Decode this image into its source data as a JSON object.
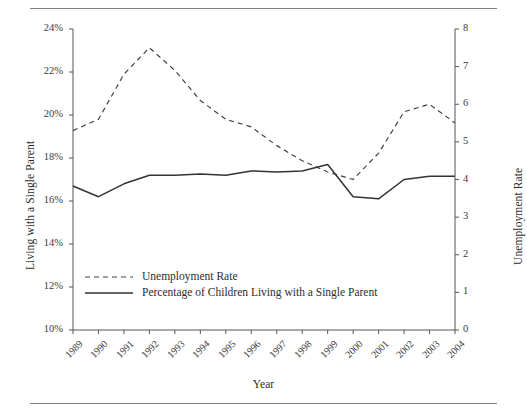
{
  "chart_data": {
    "type": "line",
    "title": "",
    "xlabel": "Year",
    "ylabel": "Living with a Single Parent",
    "ylabel_secondary": "Unemployment Rate",
    "grid": false,
    "legend_position": "inside-bottom-left",
    "categories": [
      "1989",
      "1990",
      "1991",
      "1992",
      "1993",
      "1994",
      "1995",
      "1996",
      "1997",
      "1998",
      "1999",
      "2000",
      "2001",
      "2002",
      "2003",
      "2004"
    ],
    "axes": {
      "left": {
        "label": "Living with a Single Parent",
        "ylim": [
          10,
          24
        ],
        "tick_step": 2,
        "ticks": [
          "10%",
          "12%",
          "14%",
          "16%",
          "18%",
          "20%",
          "22%",
          "24%"
        ],
        "tick_values": [
          10,
          12,
          14,
          16,
          18,
          20,
          22,
          24
        ]
      },
      "right": {
        "label": "Unemployment Rate",
        "ylim": [
          0,
          8
        ],
        "tick_step": 1,
        "ticks": [
          "0",
          "1",
          "2",
          "3",
          "4",
          "5",
          "6",
          "7",
          "8"
        ],
        "tick_values": [
          0,
          1,
          2,
          3,
          4,
          5,
          6,
          7,
          8
        ]
      }
    },
    "series": [
      {
        "name": "Unemployment Rate",
        "axis": "right",
        "style": "dashed",
        "color": "#444444",
        "values": [
          5.3,
          5.6,
          6.8,
          7.5,
          6.9,
          6.1,
          5.6,
          5.4,
          4.9,
          4.5,
          4.2,
          4.0,
          4.7,
          5.8,
          6.0,
          5.5
        ]
      },
      {
        "name": "Percentage of Children Living with a Single Parent",
        "axis": "left",
        "style": "solid",
        "color": "#333333",
        "values": [
          16.7,
          16.2,
          16.8,
          17.2,
          17.2,
          17.25,
          17.2,
          17.4,
          17.35,
          17.4,
          17.7,
          16.2,
          16.1,
          17.0,
          17.15,
          17.15
        ]
      }
    ],
    "legend": [
      {
        "label": "Unemployment Rate",
        "style": "dashed"
      },
      {
        "label": "Percentage of Children Living with a Single Parent",
        "style": "solid"
      }
    ]
  },
  "colors": {
    "axis": "#555555",
    "text": "#2e2e2e",
    "rule": "#808080",
    "dashed_series": "#444444",
    "solid_series": "#333333",
    "background": "#ffffff"
  }
}
